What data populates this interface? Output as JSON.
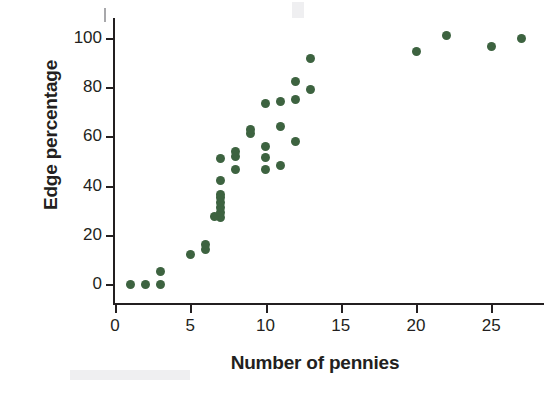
{
  "chart_data": {
    "type": "scatter",
    "title": "",
    "xlabel": "Number of pennies",
    "ylabel": "Edge percentage",
    "xlim": [
      0,
      28.6
    ],
    "ylim": [
      -4,
      108
    ],
    "grid": false,
    "legend": null,
    "marker_color": "#3d6340",
    "axis_color": "#231f20",
    "xticks": [
      0,
      5,
      10,
      15,
      20,
      25
    ],
    "xtick_labels": [
      "0",
      "5",
      "10",
      "15",
      "20",
      "25"
    ],
    "yticks": [
      0,
      20,
      40,
      60,
      80,
      100
    ],
    "ytick_labels": [
      "0",
      "20",
      "40",
      "60",
      "80",
      "100"
    ],
    "points": [
      {
        "x": 1,
        "y": 0
      },
      {
        "x": 2,
        "y": 0
      },
      {
        "x": 3,
        "y": 0
      },
      {
        "x": 3,
        "y": 5
      },
      {
        "x": 5,
        "y": 12
      },
      {
        "x": 6,
        "y": 14
      },
      {
        "x": 6,
        "y": 16
      },
      {
        "x": 7,
        "y": 27
      },
      {
        "x": 6.6,
        "y": 27.5
      },
      {
        "x": 7,
        "y": 29
      },
      {
        "x": 7,
        "y": 31
      },
      {
        "x": 7,
        "y": 33
      },
      {
        "x": 7,
        "y": 35
      },
      {
        "x": 7,
        "y": 36.5
      },
      {
        "x": 7,
        "y": 42
      },
      {
        "x": 7,
        "y": 51
      },
      {
        "x": 8,
        "y": 46.5
      },
      {
        "x": 8,
        "y": 52
      },
      {
        "x": 8,
        "y": 54
      },
      {
        "x": 9,
        "y": 61
      },
      {
        "x": 9,
        "y": 63
      },
      {
        "x": 10,
        "y": 46.5
      },
      {
        "x": 10,
        "y": 51.5
      },
      {
        "x": 10,
        "y": 56
      },
      {
        "x": 10,
        "y": 73.5
      },
      {
        "x": 11,
        "y": 48
      },
      {
        "x": 11,
        "y": 64
      },
      {
        "x": 11,
        "y": 74
      },
      {
        "x": 12,
        "y": 58
      },
      {
        "x": 12,
        "y": 75
      },
      {
        "x": 12,
        "y": 82.5
      },
      {
        "x": 13,
        "y": 79
      },
      {
        "x": 13,
        "y": 91.5
      },
      {
        "x": 20,
        "y": 94.5
      },
      {
        "x": 22,
        "y": 101
      },
      {
        "x": 25,
        "y": 96.5
      },
      {
        "x": 27,
        "y": 100
      }
    ]
  }
}
